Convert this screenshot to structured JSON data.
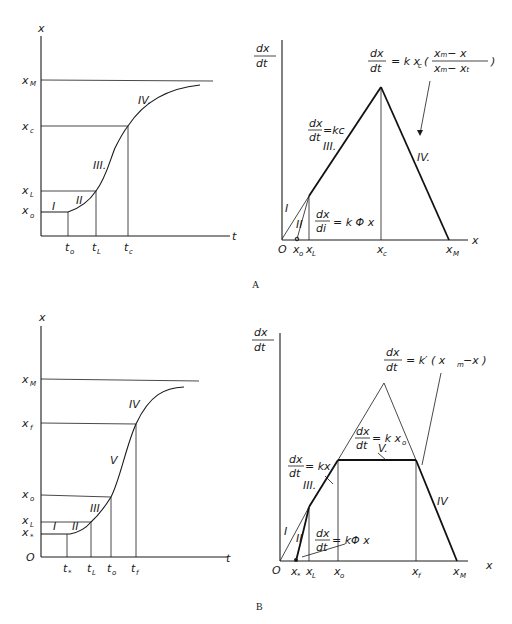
{
  "figure": {
    "panels": [
      {
        "id": "A",
        "caption": "A",
        "left_plot": {
          "y_axis_label": "x",
          "x_axis_label": "t",
          "y_ticks": [
            {
              "base": "x",
              "sub": "M"
            },
            {
              "base": "x",
              "sub": "c"
            },
            {
              "base": "x",
              "sub": "L"
            },
            {
              "base": "x",
              "sub": "o"
            }
          ],
          "x_ticks": [
            {
              "base": "t",
              "sub": "o"
            },
            {
              "base": "t",
              "sub": "L"
            },
            {
              "base": "t",
              "sub": "c"
            }
          ],
          "phases": [
            "I",
            "II",
            "III.",
            "IV."
          ]
        },
        "right_plot": {
          "y_axis_label_num": "dx",
          "y_axis_label_den": "dt",
          "x_axis_label": "x",
          "origin": "O",
          "x_ticks": [
            {
              "base": "x",
              "sub": "o"
            },
            {
              "base": "x",
              "sub": "L"
            },
            {
              "base": "x",
              "sub": "c"
            },
            {
              "base": "x",
              "sub": "M"
            }
          ],
          "phases": [
            "I",
            "II",
            "III.",
            "IV."
          ],
          "equations": {
            "phase3": {
              "num": "dx",
              "den": "dt",
              "rhs": "=kc"
            },
            "phase2": {
              "num": "dx",
              "den": "di",
              "rhs": "= k Φ x"
            },
            "phase4": {
              "num": "dx",
              "den": "dt",
              "rhs_prefix": "= k x",
              "rhs_sub": "c",
              "frac_num": "xₘ− x",
              "frac_den": "xₘ− xₜ",
              "open": "(",
              "close": ")"
            }
          }
        }
      },
      {
        "id": "B",
        "caption": "B",
        "left_plot": {
          "y_axis_label": "x",
          "x_axis_label": "t",
          "origin": "O",
          "y_ticks": [
            {
              "base": "x",
              "sub": "M"
            },
            {
              "base": "x",
              "sub": "f"
            },
            {
              "base": "x",
              "sub": "o"
            },
            {
              "base": "x",
              "sub": "L"
            },
            {
              "base": "x",
              "sub": "*"
            }
          ],
          "x_ticks": [
            {
              "base": "t",
              "sub": "*"
            },
            {
              "base": "t",
              "sub": "L"
            },
            {
              "base": "t",
              "sub": "o"
            },
            {
              "base": "t",
              "sub": "f"
            }
          ],
          "phases": [
            "I",
            "II",
            "III",
            "V",
            "IV"
          ]
        },
        "right_plot": {
          "y_axis_label_num": "dx",
          "y_axis_label_den": "dt",
          "x_axis_label": "x",
          "origin": "O",
          "x_ticks": [
            {
              "base": "x",
              "sub": "*"
            },
            {
              "base": "x",
              "sub": "L"
            },
            {
              "base": "x",
              "sub": "o"
            },
            {
              "base": "x",
              "sub": "f"
            },
            {
              "base": "x",
              "sub": "M"
            }
          ],
          "phases": [
            "I",
            "II",
            "III.",
            "V.",
            "IV"
          ],
          "equations": {
            "phase3": {
              "num": "dx",
              "den": "dt",
              "rhs": "= kx"
            },
            "phase5": {
              "num": "dx",
              "den": "dt",
              "rhs": "= k x",
              "rhs_sub": "o"
            },
            "phase2": {
              "num": "dx",
              "den": "dt",
              "rhs": "= kΦ x"
            },
            "phase4": {
              "num": "dx",
              "den": "dt",
              "rhs": "= k′ ( x",
              "rhs_sub": "m",
              "rhs_tail": "−x )"
            }
          }
        }
      }
    ]
  }
}
